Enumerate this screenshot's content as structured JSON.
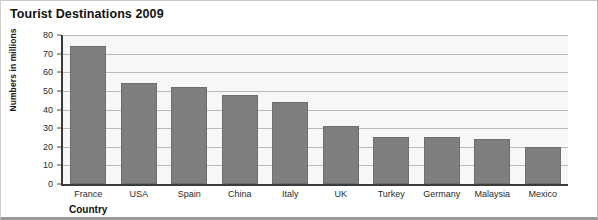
{
  "chart_data": {
    "type": "bar",
    "title": "Tourist Destinations 2009",
    "xlabel": "Country",
    "ylabel": "Numbers in millions",
    "categories": [
      "France",
      "USA",
      "Spain",
      "China",
      "Italy",
      "UK",
      "Turkey",
      "Germany",
      "Malaysia",
      "Mexico"
    ],
    "values": [
      74,
      54,
      52,
      48,
      44,
      31,
      25,
      25,
      24,
      20
    ],
    "ylim": [
      0,
      80
    ],
    "yticks": [
      0,
      10,
      20,
      30,
      40,
      50,
      60,
      70,
      80
    ],
    "grid": true,
    "legend": false,
    "bar_color": "#7f7f7f",
    "plot_background": "#f7f7f5",
    "gridline_color": "#b9b9b9",
    "axis_color": "#3a3a3a"
  }
}
